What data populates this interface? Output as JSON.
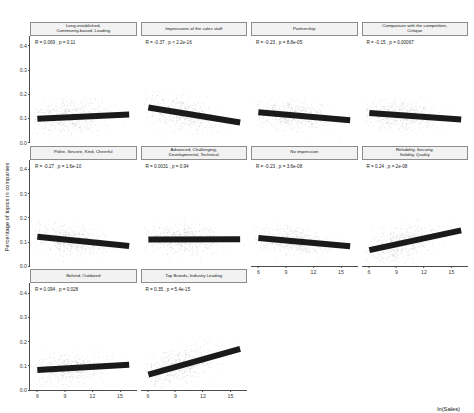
{
  "chart_data": {
    "type": "scatter",
    "title": "",
    "xlabel": "ln(Sales)",
    "ylabel": "Percentage of topics in companies",
    "xlim": [
      5.2,
      16.8
    ],
    "ylim": [
      0.0,
      0.44
    ],
    "xticks": [
      "6",
      "9",
      "12",
      "15"
    ],
    "xtick_values": [
      6,
      9,
      12,
      15
    ],
    "yticks": [
      "0.0",
      "0.1",
      "0.2",
      "0.3",
      "0.4"
    ],
    "ytick_values": [
      0.0,
      0.1,
      0.2,
      0.3,
      0.4
    ],
    "grid": false,
    "legend": "none",
    "point_color": "#9a9a9a",
    "line_color": "#1a1a1a",
    "strip_bg": "#f2f2f2",
    "panels": [
      {
        "title": "Long-established,\nCommunity-based, Leading",
        "stats": "R = 0.069 , p = 0.11",
        "R": 0.069,
        "p": "0.11",
        "fit_y_at_x6": 0.099,
        "fit_y_at_x16": 0.116,
        "n_points": 560,
        "mean_y": 0.108,
        "spread_y": 0.04
      },
      {
        "title": "Impressions of the sales staff",
        "stats": "R = -0.37 , p < 2.2e-16",
        "R": -0.37,
        "p": "< 2.2e-16",
        "fit_y_at_x6": 0.145,
        "fit_y_at_x16": 0.083,
        "n_points": 560,
        "mean_y": 0.112,
        "spread_y": 0.043
      },
      {
        "title": "Partnership",
        "stats": "R = -0.23 , p = 8.8e-05",
        "R": -0.23,
        "p": "8.8e-05",
        "fit_y_at_x6": 0.125,
        "fit_y_at_x16": 0.092,
        "n_points": 560,
        "mean_y": 0.107,
        "spread_y": 0.036
      },
      {
        "title": "Comparison with the competition,\nCritique",
        "stats": "R = -0.15 , p = 0.00067",
        "R": -0.15,
        "p": "0.00067",
        "fit_y_at_x6": 0.122,
        "fit_y_at_x16": 0.096,
        "n_points": 560,
        "mean_y": 0.108,
        "spread_y": 0.036
      },
      {
        "title": "Polite, Sincere, Kind, Cheerful",
        "stats": "R = -0.27 , p = 1.6e-10",
        "R": -0.27,
        "p": "1.6e-10",
        "fit_y_at_x6": 0.123,
        "fit_y_at_x16": 0.085,
        "n_points": 560,
        "mean_y": 0.106,
        "spread_y": 0.038
      },
      {
        "title": "Advanced, Challenging,\nDevelopmental, Technical",
        "stats": "R = 0.0031 , p = 0.94",
        "R": 0.0031,
        "p": "0.94",
        "fit_y_at_x6": 0.112,
        "fit_y_at_x16": 0.113,
        "n_points": 560,
        "mean_y": 0.112,
        "spread_y": 0.038
      },
      {
        "title": "No impression",
        "stats": "R = -0.23 , p = 3.6e-08",
        "R": -0.23,
        "p": "3.6e-08",
        "fit_y_at_x6": 0.118,
        "fit_y_at_x16": 0.084,
        "n_points": 560,
        "mean_y": 0.102,
        "spread_y": 0.035
      },
      {
        "title": "Reliability, Security,\nSolidity, Quality",
        "stats": "R = 0.24 , p = 2e-08",
        "R": 0.24,
        "p": "2e-08",
        "fit_y_at_x6": 0.068,
        "fit_y_at_x16": 0.15,
        "n_points": 560,
        "mean_y": 0.105,
        "spread_y": 0.041
      },
      {
        "title": "Behind, Outdated",
        "stats": "R = 0.094 , p = 0.028",
        "R": 0.094,
        "p": "0.028",
        "fit_y_at_x6": 0.081,
        "fit_y_at_x16": 0.103,
        "n_points": 560,
        "mean_y": 0.093,
        "spread_y": 0.035
      },
      {
        "title": "Top Brands, Industry Leading",
        "stats": "R = 0.35 , p = 5.4e-15",
        "R": 0.35,
        "p": "5.4e-15",
        "fit_y_at_x6": 0.062,
        "fit_y_at_x16": 0.168,
        "n_points": 560,
        "mean_y": 0.104,
        "spread_y": 0.042
      }
    ]
  }
}
